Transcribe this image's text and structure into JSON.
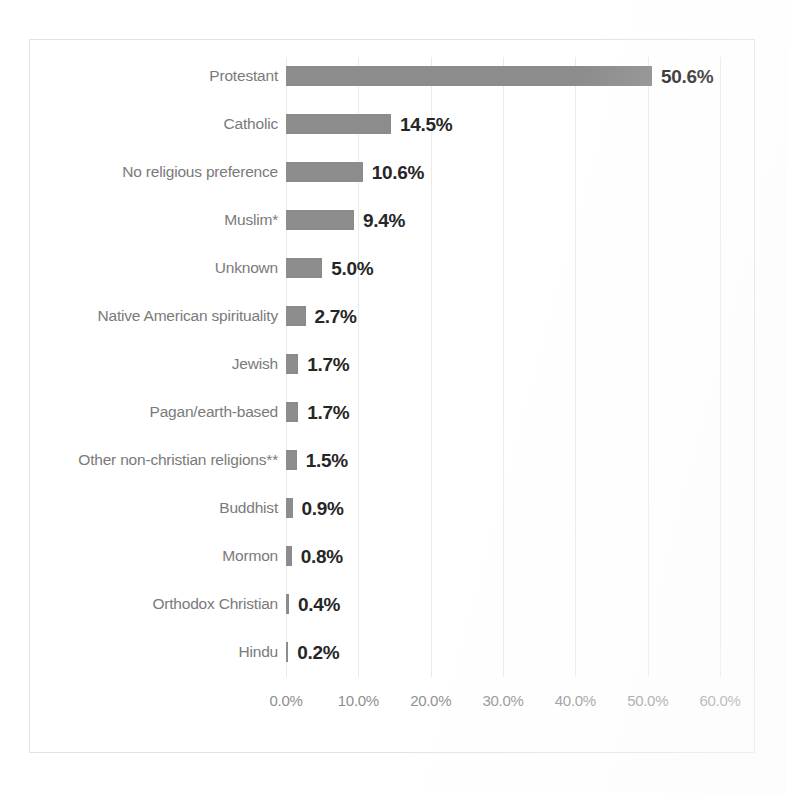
{
  "chart_data": {
    "type": "bar",
    "orientation": "horizontal",
    "title": "",
    "xlabel": "",
    "ylabel": "",
    "xlim": [
      0,
      60
    ],
    "grid": true,
    "legend": false,
    "bar_color": "#8c8c8c",
    "categories": [
      "Protestant",
      "Catholic",
      "No religious preference",
      "Muslim*",
      "Unknown",
      "Native American spirituality",
      "Jewish",
      "Pagan/earth-based",
      "Other non-christian religions**",
      "Buddhist",
      "Mormon",
      "Orthodox Christian",
      "Hindu"
    ],
    "values": [
      50.6,
      14.5,
      10.6,
      9.4,
      5.0,
      2.7,
      1.7,
      1.7,
      1.5,
      0.9,
      0.8,
      0.4,
      0.2
    ],
    "data_labels": [
      "50.6%",
      "14.5%",
      "10.6%",
      "9.4%",
      "5.0%",
      "2.7%",
      "1.7%",
      "1.7%",
      "1.5%",
      "0.9%",
      "0.8%",
      "0.4%",
      "0.2%"
    ],
    "xticks": [
      0,
      10,
      20,
      30,
      40,
      50,
      60
    ],
    "xticklabels": [
      "0.0%",
      "10.0%",
      "20.0%",
      "30.0%",
      "40.0%",
      "50.0%",
      "60.0%"
    ]
  }
}
